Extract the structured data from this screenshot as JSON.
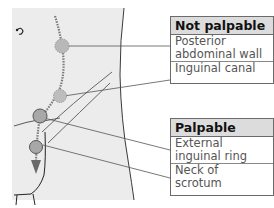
{
  "diagram": {
    "type": "anatomical label diagram",
    "colors": {
      "body_fill": "#ececec",
      "header_fill": "#dcdcdc",
      "outline": "#3a3a3a",
      "marker_fill": "#b8b8b8",
      "leader_line": "#555555"
    },
    "groups": [
      {
        "title": "Not palpable",
        "items": [
          {
            "lines": [
              "Posterior",
              "abdominal wall"
            ],
            "marker": "dashed-circle"
          },
          {
            "lines": [
              "Inguinal canal"
            ],
            "marker": "dashed-circle"
          }
        ]
      },
      {
        "title": "Palpable",
        "items": [
          {
            "lines": [
              "External",
              "inguinal ring"
            ],
            "marker": "solid-circle"
          },
          {
            "lines": [
              "Neck of",
              "scrotum"
            ],
            "marker": "solid-circle"
          }
        ]
      }
    ],
    "path_arrow": "downward dotted arrow showing descent",
    "umbilicus_symbol": "navel-icon"
  }
}
